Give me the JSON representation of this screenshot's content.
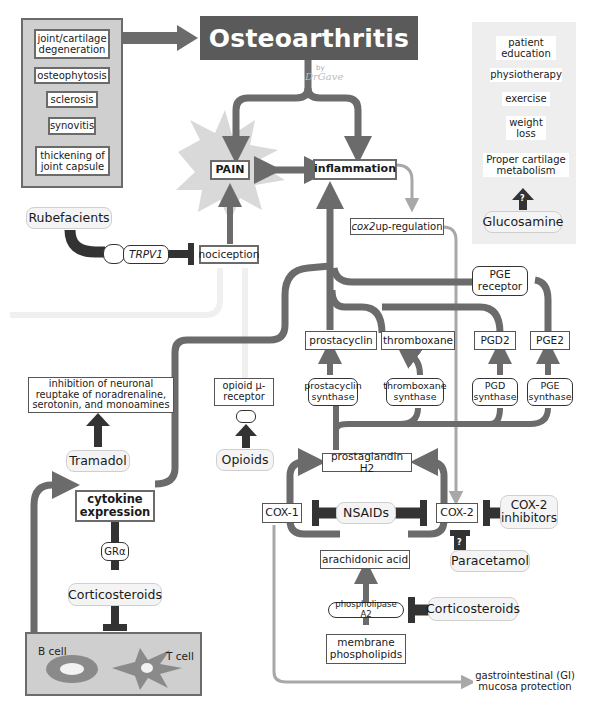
{
  "title": "Osteoarthritis",
  "signature": {
    "by": "by",
    "author": "DrGave"
  },
  "colors": {
    "arrow": "#6b6b6b",
    "inhibitor": "#333333",
    "light_arrow": "#a8a8a8",
    "panel": "#cfcfcf",
    "title_bg": "#5a5a5a"
  },
  "features_panel": {
    "items": [
      "joint/cartilage degeneration",
      "osteophytosis",
      "sclerosis",
      "synovitis",
      "thickening of joint capsule"
    ]
  },
  "management_panel": {
    "items": [
      "patient education",
      "physiotherapy",
      "exercise",
      "weight loss",
      "Proper cartilage metabolism"
    ],
    "drug": "Glucosamine",
    "uncertain_mark": "?"
  },
  "nodes": {
    "pain": "PAIN",
    "inflammation": "inflammation",
    "cox2_up": {
      "italic": "cox2",
      "rest": " up-regulation"
    },
    "nociception": "nociception",
    "trpv1": "TRPV1",
    "rubefacients": "Rubefacients",
    "pge_receptor": "PGE receptor",
    "tramadol_effect": "inhibition of neuronal reuptake of noradrenaline, serotonin, and monoamines",
    "tramadol": "Tramadol",
    "opioid_receptor": "opioid µ-receptor",
    "opioids": "Opioids",
    "prostacyclin": "prostacyclin",
    "thromboxane": "thromboxane",
    "pgd2": "PGD2",
    "pge2": "PGE2",
    "prostacyclin_synthase": "prostacyclin synthase",
    "thromboxane_synthase": "thromboxane synthase",
    "pgd_synthase": "PGD synthase",
    "pge_synthase": "PGE synthase",
    "prostaglandin_h2": "prostaglandin H2",
    "cox1": "COX-1",
    "cox2": "COX-2",
    "nsaids": "NSAIDs",
    "cox2_inhibitors": "COX-2 inhibitors",
    "paracetamol": "Paracetamol",
    "paracetamol_mark": "?",
    "arachidonic_acid": "arachidonic acid",
    "phospholipase_a2": "phospholipase A2",
    "corticosteroids_pla2": "Corticosteroids",
    "membrane_phospholipids": "membrane phospholipids",
    "gi_protection": "gastrointestinal (GI) mucosa protection",
    "cytokine_expression": "cytokine expression",
    "gr_alpha": "GRα",
    "corticosteroids_gr": "Corticosteroids",
    "b_cell": "B cell",
    "t_cell": "T cell"
  }
}
